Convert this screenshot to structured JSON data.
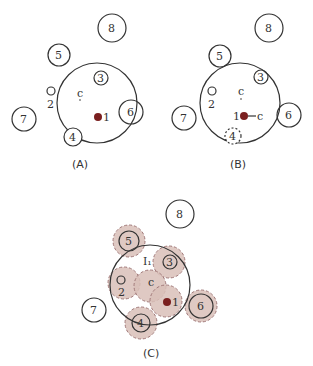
{
  "panels": [
    {
      "id": "A",
      "caption": "(A)"
    },
    {
      "id": "B",
      "caption": "(B)"
    },
    {
      "id": "C",
      "caption": "(C)"
    }
  ],
  "labels": {
    "center": "c",
    "c_moved": "c",
    "n1": "1",
    "n2": "2",
    "n3": "3",
    "n4": "4",
    "n5": "5",
    "n6": "6",
    "n7": "7",
    "n8": "8",
    "region": "I₁"
  },
  "colors": {
    "stroke": "#333333",
    "dot": "#7a1f1f",
    "shade": "#d9bfb8",
    "shade_stroke": "#a07878"
  }
}
